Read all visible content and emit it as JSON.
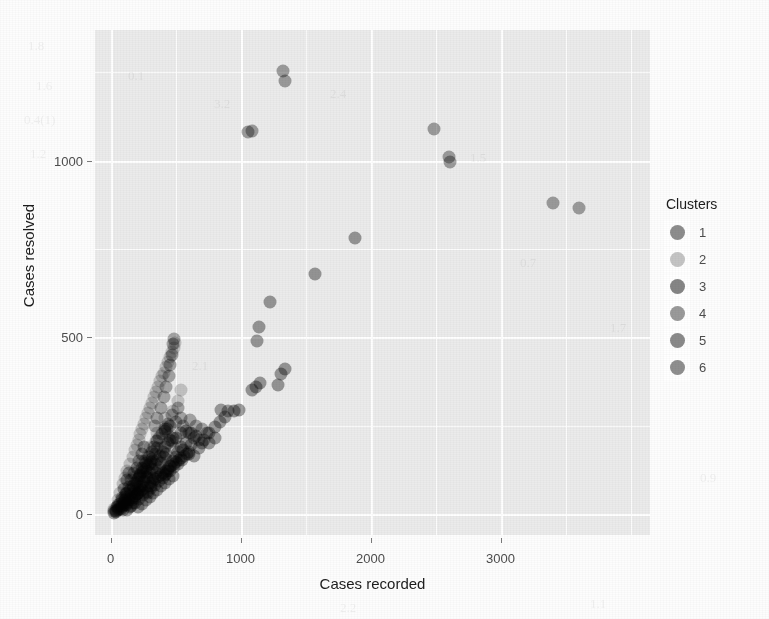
{
  "chart_data": {
    "type": "scatter",
    "title": "",
    "xlabel": "Cases recorded",
    "ylabel": "Cases resolved",
    "xlim": [
      -120,
      4150
    ],
    "ylim": [
      -60,
      1370
    ],
    "xticks": [
      0,
      1000,
      2000,
      3000
    ],
    "yticks": [
      0,
      500,
      1000
    ],
    "xtick_labels": [
      "0",
      "1000",
      "2000",
      "3000"
    ],
    "ytick_labels": [
      "0",
      "500",
      "1000"
    ],
    "grid": true,
    "grid_minor": true,
    "legend_title": "Clusters",
    "legend_position": "right",
    "legend_entries": [
      {
        "label": "1",
        "color": "#8d8d8d"
      },
      {
        "label": "2",
        "color": "#c4c4c4"
      },
      {
        "label": "3",
        "color": "#858585"
      },
      {
        "label": "4",
        "color": "#9a9a9a"
      },
      {
        "label": "5",
        "color": "#8a8a8a"
      },
      {
        "label": "6",
        "color": "#8f8f8f"
      }
    ],
    "point_size": 13,
    "point_opacity": 0.78,
    "series": [
      {
        "name": "1",
        "color": "#8d8d8d",
        "points": [
          [
            1060,
            1080
          ],
          [
            1090,
            1085
          ],
          [
            1330,
            1255
          ],
          [
            1345,
            1225
          ],
          [
            2490,
            1090
          ],
          [
            2600,
            1010
          ],
          [
            2610,
            995
          ],
          [
            3400,
            880
          ],
          [
            3600,
            865
          ]
        ]
      },
      {
        "name": "2",
        "color": "#c4c4c4",
        "points": [
          [
            30,
            15
          ],
          [
            55,
            40
          ],
          [
            75,
            60
          ],
          [
            95,
            85
          ],
          [
            110,
            100
          ],
          [
            130,
            120
          ],
          [
            150,
            140
          ],
          [
            170,
            160
          ],
          [
            185,
            180
          ],
          [
            200,
            195
          ],
          [
            215,
            210
          ],
          [
            230,
            225
          ],
          [
            245,
            240
          ],
          [
            260,
            255
          ],
          [
            275,
            270
          ],
          [
            290,
            285
          ],
          [
            305,
            300
          ],
          [
            320,
            315
          ],
          [
            335,
            330
          ],
          [
            350,
            345
          ],
          [
            365,
            360
          ],
          [
            380,
            375
          ],
          [
            395,
            390
          ],
          [
            410,
            400
          ],
          [
            425,
            415
          ],
          [
            440,
            430
          ],
          [
            455,
            445
          ],
          [
            470,
            458
          ],
          [
            485,
            470
          ],
          [
            495,
            485
          ],
          [
            60,
            20
          ],
          [
            120,
            60
          ],
          [
            180,
            105
          ],
          [
            240,
            150
          ],
          [
            300,
            190
          ],
          [
            360,
            230
          ],
          [
            420,
            270
          ],
          [
            150,
            45
          ],
          [
            210,
            80
          ],
          [
            270,
            115
          ],
          [
            330,
            150
          ],
          [
            390,
            185
          ],
          [
            450,
            220
          ],
          [
            250,
            60
          ],
          [
            310,
            95
          ],
          [
            370,
            125
          ],
          [
            430,
            155
          ],
          [
            490,
            185
          ],
          [
            130,
            25
          ],
          [
            190,
            50
          ],
          [
            95,
            30
          ],
          [
            155,
            70
          ],
          [
            220,
            120
          ],
          [
            285,
            165
          ],
          [
            350,
            205
          ],
          [
            415,
            245
          ],
          [
            480,
            290
          ],
          [
            520,
            320
          ],
          [
            540,
            350
          ],
          [
            45,
            10
          ]
        ]
      },
      {
        "name": "3",
        "color": "#858585",
        "points": [
          [
            1090,
            350
          ],
          [
            1120,
            360
          ],
          [
            1150,
            370
          ],
          [
            1310,
            395
          ],
          [
            1340,
            410
          ],
          [
            1290,
            365
          ],
          [
            1130,
            490
          ],
          [
            1145,
            530
          ],
          [
            1230,
            600
          ],
          [
            1570,
            680
          ],
          [
            1880,
            780
          ],
          [
            950,
            290
          ],
          [
            990,
            295
          ]
        ]
      },
      {
        "name": "4",
        "color": "#9a9a9a",
        "points": [
          [
            390,
            300
          ],
          [
            410,
            330
          ],
          [
            430,
            360
          ],
          [
            450,
            390
          ],
          [
            460,
            420
          ],
          [
            470,
            450
          ],
          [
            480,
            480
          ],
          [
            490,
            495
          ],
          [
            520,
            300
          ],
          [
            540,
            270
          ],
          [
            560,
            250
          ],
          [
            600,
            230
          ],
          [
            640,
            215
          ],
          [
            680,
            210
          ],
          [
            500,
            260
          ],
          [
            470,
            280
          ],
          [
            440,
            255
          ],
          [
            420,
            240
          ],
          [
            610,
            265
          ],
          [
            655,
            250
          ],
          [
            700,
            240
          ],
          [
            740,
            230
          ],
          [
            360,
            270
          ],
          [
            340,
            250
          ]
        ]
      },
      {
        "name": "5",
        "color": "#8a8a8a",
        "points": [
          [
            560,
            180
          ],
          [
            600,
            170
          ],
          [
            640,
            165
          ],
          [
            680,
            185
          ],
          [
            700,
            200
          ],
          [
            620,
            195
          ],
          [
            580,
            200
          ],
          [
            540,
            190
          ],
          [
            520,
            175
          ],
          [
            720,
            210
          ],
          [
            760,
            230
          ],
          [
            800,
            245
          ],
          [
            840,
            260
          ],
          [
            880,
            275
          ],
          [
            900,
            290
          ],
          [
            500,
            160
          ],
          [
            480,
            150
          ],
          [
            460,
            135
          ],
          [
            440,
            120
          ],
          [
            420,
            110
          ],
          [
            760,
            200
          ],
          [
            800,
            215
          ],
          [
            660,
            220
          ],
          [
            620,
            230
          ],
          [
            580,
            235
          ],
          [
            540,
            230
          ],
          [
            500,
            215
          ],
          [
            470,
            205
          ],
          [
            850,
            295
          ]
        ]
      },
      {
        "name": "6",
        "color": "#8f8f8f",
        "points": [
          [
            60,
            25
          ],
          [
            85,
            45
          ],
          [
            105,
            70
          ],
          [
            125,
            95
          ],
          [
            145,
            115
          ],
          [
            165,
            40
          ],
          [
            185,
            65
          ],
          [
            205,
            90
          ],
          [
            225,
            110
          ],
          [
            245,
            130
          ],
          [
            265,
            150
          ],
          [
            80,
            15
          ],
          [
            100,
            35
          ],
          [
            120,
            55
          ],
          [
            140,
            75
          ],
          [
            160,
            95
          ],
          [
            180,
            115
          ],
          [
            200,
            130
          ],
          [
            220,
            150
          ],
          [
            240,
            170
          ],
          [
            260,
            190
          ],
          [
            280,
            120
          ],
          [
            300,
            140
          ],
          [
            320,
            155
          ],
          [
            340,
            170
          ],
          [
            360,
            185
          ],
          [
            150,
            20
          ],
          [
            170,
            30
          ],
          [
            190,
            45
          ],
          [
            210,
            60
          ],
          [
            230,
            75
          ],
          [
            250,
            90
          ],
          [
            270,
            105
          ],
          [
            290,
            60
          ],
          [
            310,
            80
          ],
          [
            330,
            100
          ],
          [
            350,
            115
          ],
          [
            370,
            130
          ],
          [
            390,
            145
          ],
          [
            410,
            160
          ],
          [
            430,
            170
          ],
          [
            95,
            10
          ],
          [
            115,
            25
          ],
          [
            135,
            40
          ],
          [
            155,
            55
          ],
          [
            175,
            70
          ],
          [
            195,
            85
          ],
          [
            215,
            100
          ],
          [
            235,
            115
          ],
          [
            255,
            130
          ],
          [
            275,
            145
          ],
          [
            295,
            160
          ],
          [
            315,
            175
          ],
          [
            335,
            190
          ],
          [
            355,
            205
          ],
          [
            375,
            215
          ],
          [
            395,
            225
          ],
          [
            415,
            235
          ],
          [
            435,
            240
          ],
          [
            455,
            250
          ],
          [
            30,
            8
          ],
          [
            50,
            18
          ],
          [
            70,
            28
          ],
          [
            90,
            38
          ],
          [
            110,
            48
          ],
          [
            130,
            58
          ],
          [
            150,
            68
          ],
          [
            170,
            78
          ],
          [
            190,
            88
          ],
          [
            210,
            98
          ],
          [
            230,
            108
          ],
          [
            250,
            118
          ],
          [
            270,
            128
          ],
          [
            290,
            138
          ],
          [
            310,
            148
          ],
          [
            40,
            5
          ],
          [
            60,
            12
          ],
          [
            80,
            22
          ],
          [
            100,
            32
          ],
          [
            120,
            42
          ],
          [
            200,
            55
          ],
          [
            220,
            68
          ],
          [
            240,
            80
          ],
          [
            260,
            92
          ],
          [
            280,
            104
          ],
          [
            300,
            116
          ],
          [
            320,
            128
          ],
          [
            340,
            140
          ],
          [
            360,
            152
          ],
          [
            380,
            164
          ],
          [
            400,
            176
          ],
          [
            420,
            188
          ],
          [
            440,
            200
          ],
          [
            460,
            208
          ],
          [
            480,
            215
          ],
          [
            130,
            12
          ],
          [
            160,
            22
          ],
          [
            190,
            32
          ],
          [
            220,
            42
          ],
          [
            250,
            52
          ],
          [
            280,
            62
          ],
          [
            310,
            72
          ],
          [
            340,
            82
          ],
          [
            370,
            92
          ],
          [
            400,
            102
          ],
          [
            430,
            112
          ],
          [
            460,
            122
          ],
          [
            490,
            132
          ],
          [
            520,
            142
          ],
          [
            550,
            152
          ],
          [
            210,
            18
          ],
          [
            240,
            28
          ],
          [
            270,
            38
          ],
          [
            300,
            48
          ],
          [
            330,
            58
          ],
          [
            360,
            68
          ],
          [
            390,
            78
          ],
          [
            420,
            88
          ],
          [
            450,
            98
          ],
          [
            480,
            108
          ],
          [
            25,
            3
          ],
          [
            45,
            8
          ],
          [
            65,
            14
          ],
          [
            85,
            20
          ],
          [
            105,
            26
          ],
          [
            125,
            32
          ],
          [
            145,
            38
          ],
          [
            165,
            44
          ],
          [
            185,
            50
          ],
          [
            205,
            56
          ],
          [
            225,
            62
          ],
          [
            245,
            68
          ],
          [
            265,
            74
          ],
          [
            285,
            80
          ],
          [
            305,
            86
          ],
          [
            325,
            92
          ],
          [
            345,
            98
          ],
          [
            365,
            104
          ],
          [
            385,
            110
          ],
          [
            405,
            116
          ],
          [
            425,
            122
          ],
          [
            445,
            128
          ],
          [
            465,
            134
          ],
          [
            485,
            140
          ],
          [
            505,
            146
          ],
          [
            525,
            152
          ],
          [
            545,
            158
          ],
          [
            565,
            164
          ],
          [
            585,
            170
          ],
          [
            605,
            176
          ]
        ]
      }
    ]
  },
  "ghost_marks": [
    {
      "text": "1.8",
      "x": 28,
      "y": 38
    },
    {
      "text": "1.6",
      "x": 36,
      "y": 78
    },
    {
      "text": "0.4(1)",
      "x": 24,
      "y": 112
    },
    {
      "text": "1.2",
      "x": 30,
      "y": 146
    },
    {
      "text": "0.1",
      "x": 128,
      "y": 68
    },
    {
      "text": "3.2",
      "x": 214,
      "y": 96
    },
    {
      "text": "2.4",
      "x": 330,
      "y": 86
    },
    {
      "text": "1.5",
      "x": 470,
      "y": 150
    },
    {
      "text": "0.7",
      "x": 520,
      "y": 255
    },
    {
      "text": "0.3",
      "x": 150,
      "y": 430
    },
    {
      "text": "2.1",
      "x": 192,
      "y": 358
    },
    {
      "text": "1.7",
      "x": 610,
      "y": 320
    },
    {
      "text": "0.9",
      "x": 700,
      "y": 470
    },
    {
      "text": "2.2",
      "x": 340,
      "y": 600
    },
    {
      "text": "1.1",
      "x": 590,
      "y": 596
    }
  ]
}
